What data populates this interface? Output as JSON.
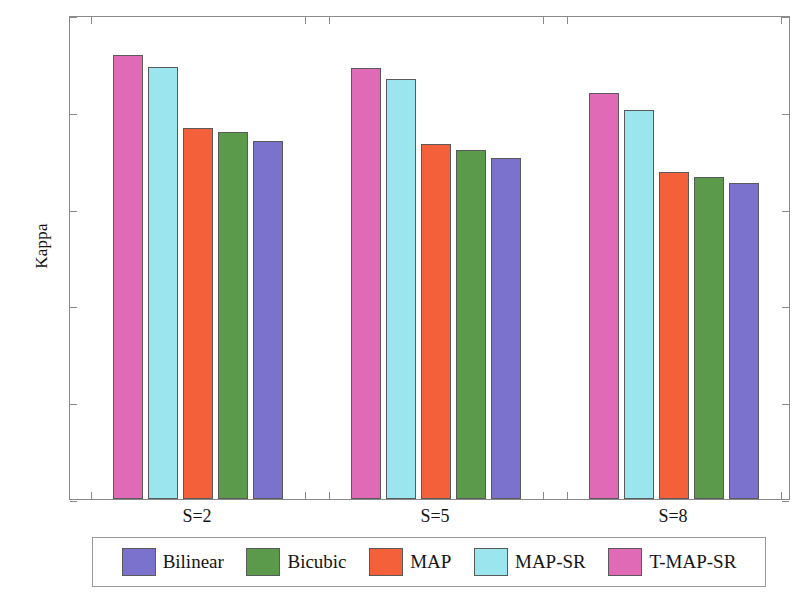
{
  "chart_data": {
    "type": "bar",
    "title": "",
    "subtitle": "",
    "xlabel": "",
    "ylabel": "Kappa",
    "categories": [
      "S=2",
      "S=5",
      "S=8"
    ],
    "ylim": [
      0,
      1
    ],
    "yticks": [
      0,
      0.2,
      0.4,
      0.6,
      0.8,
      1
    ],
    "ytick_labels": [
      "0",
      "0.2",
      "0.4",
      "0.6",
      "0.8",
      "1"
    ],
    "grid": false,
    "legend_position": "below-axes",
    "bar_order_in_group": [
      "T-MAP-SR",
      "MAP-SR",
      "MAP",
      "Bicubic",
      "Bilinear"
    ],
    "series": [
      {
        "name": "Bilinear",
        "color": "#7a72cc",
        "values": [
          0.74,
          0.704,
          0.653
        ]
      },
      {
        "name": "Bicubic",
        "color": "#5a9a4a",
        "values": [
          0.758,
          0.721,
          0.665
        ]
      },
      {
        "name": "MAP",
        "color": "#f4603a",
        "values": [
          0.766,
          0.733,
          0.675
        ]
      },
      {
        "name": "MAP-SR",
        "color": "#9ae5ee",
        "values": [
          0.892,
          0.868,
          0.804
        ]
      },
      {
        "name": "T-MAP-SR",
        "color": "#e06ab5",
        "values": [
          0.917,
          0.89,
          0.839
        ]
      }
    ]
  },
  "legend": {
    "entries": [
      {
        "label": "Bilinear",
        "color": "#7a72cc"
      },
      {
        "label": "Bicubic",
        "color": "#5a9a4a"
      },
      {
        "label": "MAP",
        "color": "#f4603a"
      },
      {
        "label": "MAP-SR",
        "color": "#9ae5ee"
      },
      {
        "label": "T-MAP-SR",
        "color": "#e06ab5"
      }
    ]
  },
  "axes": {
    "y_axis_title": "Kappa",
    "y_tick_labels": [
      "1",
      "0.8",
      "0.6",
      "0.4",
      "0.2",
      "0"
    ],
    "x_tick_labels": [
      "S=2",
      "S=5",
      "S=8"
    ]
  }
}
